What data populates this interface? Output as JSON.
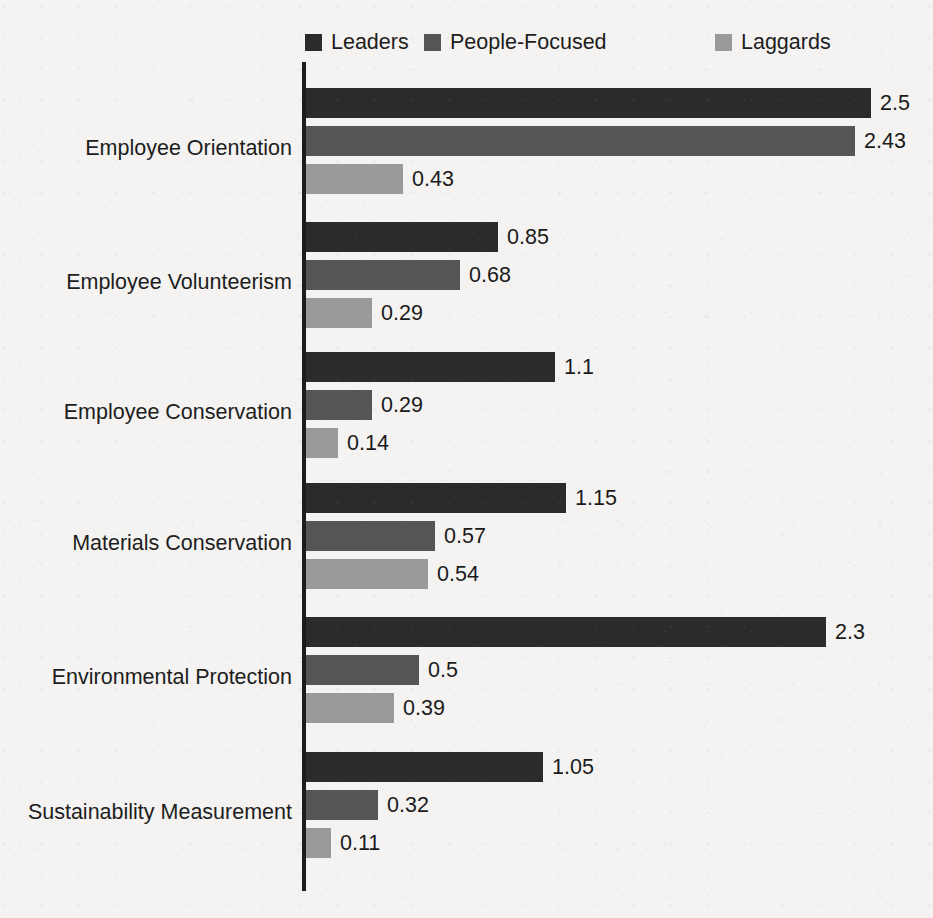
{
  "legend": {
    "items": [
      {
        "label": "Leaders",
        "color": "#2b2b2b",
        "x": 305
      },
      {
        "label": "People-Focused",
        "color": "#555555",
        "x": 424
      },
      {
        "label": "Laggards",
        "color": "#9a9a9a",
        "x": 715
      }
    ]
  },
  "axis": {
    "baseline_x": 303,
    "px_per_unit": 226
  },
  "chart_data": {
    "type": "bar",
    "orientation": "horizontal",
    "title": "",
    "subtitle": "",
    "xlabel": "",
    "ylabel": "",
    "xlim": [
      0,
      2.5
    ],
    "grid": false,
    "legend_position": "top",
    "value_labels": true,
    "categories": [
      "Employee Orientation",
      "Employee Volunteerism",
      "Employee Conservation",
      "Materials Conservation",
      "Environmental Protection",
      "Sustainability Measurement"
    ],
    "series": [
      {
        "name": "Leaders",
        "color": "#2b2b2b",
        "values": [
          2.5,
          0.85,
          1.1,
          1.15,
          2.3,
          1.05
        ],
        "labels": [
          "2.5",
          "0.85",
          "1.1",
          "1.15",
          "2.3",
          "1.05"
        ]
      },
      {
        "name": "People-Focused",
        "color": "#555555",
        "values": [
          2.43,
          0.68,
          0.29,
          0.57,
          0.5,
          0.32
        ],
        "labels": [
          "2.43",
          "0.68",
          "0.29",
          "0.57",
          "0.5",
          "0.32"
        ]
      },
      {
        "name": "Laggards",
        "color": "#9a9a9a",
        "values": [
          0.43,
          0.29,
          0.14,
          0.54,
          0.39,
          0.11
        ],
        "labels": [
          "0.43",
          "0.29",
          "0.14",
          "0.54",
          "0.39",
          "0.11"
        ]
      }
    ],
    "group_tops": [
      88,
      222,
      352,
      483,
      617,
      752
    ],
    "group_label_tops": [
      135,
      269,
      399,
      530,
      664,
      799
    ],
    "bar_row_offsets": [
      0,
      38,
      76
    ]
  }
}
